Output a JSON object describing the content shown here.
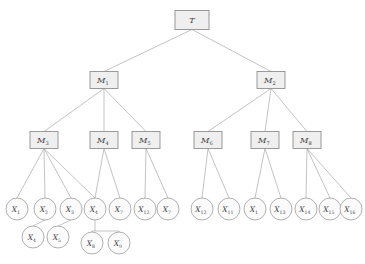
{
  "diagram": {
    "type": "tree",
    "corner_artifact": "",
    "style": {
      "background": "#ffffff",
      "edge_color": "#9a9a9a",
      "box_fill": "#efefef",
      "box_stroke": "#8f8f8f",
      "circle_fill": "#fbfbfb",
      "circle_stroke": "#8f8f8f",
      "label_color": "#3b3b3b"
    },
    "levels": [
      {
        "name": "root",
        "label": "Level 0"
      },
      {
        "name": "m-level-1",
        "label": "Level 1"
      },
      {
        "name": "m-level-2",
        "label": "Level 2"
      },
      {
        "name": "leaf-level",
        "label": "Level 3"
      },
      {
        "name": "sub-leaf-level",
        "label": "Level 4"
      }
    ],
    "nodes": [
      {
        "id": "T",
        "base": "T",
        "sub": "",
        "shape": "box",
        "x": 192,
        "y": 20,
        "w": 34,
        "h": 19
      },
      {
        "id": "M1",
        "base": "M",
        "sub": "1",
        "shape": "box",
        "x": 104,
        "y": 80,
        "w": 28,
        "h": 17
      },
      {
        "id": "M2",
        "base": "M",
        "sub": "2",
        "shape": "box",
        "x": 271,
        "y": 80,
        "w": 28,
        "h": 17
      },
      {
        "id": "M3",
        "base": "M",
        "sub": "3",
        "shape": "box",
        "x": 44,
        "y": 140,
        "w": 28,
        "h": 17
      },
      {
        "id": "M4",
        "base": "M",
        "sub": "4",
        "shape": "box",
        "x": 104,
        "y": 140,
        "w": 28,
        "h": 17
      },
      {
        "id": "M5",
        "base": "M",
        "sub": "5",
        "shape": "box",
        "x": 146,
        "y": 140,
        "w": 28,
        "h": 17
      },
      {
        "id": "M6",
        "base": "M",
        "sub": "6",
        "shape": "box",
        "x": 208,
        "y": 140,
        "w": 28,
        "h": 17
      },
      {
        "id": "M7",
        "base": "M",
        "sub": "7",
        "shape": "box",
        "x": 265,
        "y": 140,
        "w": 28,
        "h": 17
      },
      {
        "id": "M8",
        "base": "M",
        "sub": "8",
        "shape": "box",
        "x": 307,
        "y": 140,
        "w": 28,
        "h": 17
      },
      {
        "id": "X1",
        "base": "X",
        "sub": "1",
        "shape": "circle",
        "x": 17,
        "y": 209,
        "r": 11
      },
      {
        "id": "X2",
        "base": "X",
        "sub": "2",
        "shape": "circle",
        "x": 45,
        "y": 209,
        "r": 11
      },
      {
        "id": "X3",
        "base": "X",
        "sub": "3",
        "shape": "circle",
        "x": 71,
        "y": 209,
        "r": 11
      },
      {
        "id": "X4",
        "base": "X",
        "sub": "4",
        "shape": "circle",
        "x": 95,
        "y": 209,
        "r": 11
      },
      {
        "id": "X7a",
        "base": "X",
        "sub": "7",
        "shape": "circle",
        "x": 120,
        "y": 209,
        "r": 11
      },
      {
        "id": "X12a",
        "base": "X",
        "sub": "12",
        "shape": "circle",
        "x": 145,
        "y": 209,
        "r": 11
      },
      {
        "id": "X7b",
        "base": "X",
        "sub": "7",
        "shape": "circle",
        "x": 168,
        "y": 209,
        "r": 11
      },
      {
        "id": "X12b",
        "base": "X",
        "sub": "12",
        "shape": "circle",
        "x": 202,
        "y": 209,
        "r": 11
      },
      {
        "id": "X11",
        "base": "X",
        "sub": "11",
        "shape": "circle",
        "x": 229,
        "y": 209,
        "r": 11
      },
      {
        "id": "X1b",
        "base": "X",
        "sub": "1",
        "shape": "circle",
        "x": 255,
        "y": 209,
        "r": 11
      },
      {
        "id": "X13",
        "base": "X",
        "sub": "13",
        "shape": "circle",
        "x": 281,
        "y": 209,
        "r": 11
      },
      {
        "id": "X14",
        "base": "X",
        "sub": "14",
        "shape": "circle",
        "x": 306,
        "y": 209,
        "r": 11
      },
      {
        "id": "X15",
        "base": "X",
        "sub": "15",
        "shape": "circle",
        "x": 330,
        "y": 209,
        "r": 11
      },
      {
        "id": "X16",
        "base": "X",
        "sub": "16",
        "shape": "circle",
        "x": 351,
        "y": 209,
        "r": 11
      },
      {
        "id": "X4b",
        "base": "X",
        "sub": "4",
        "shape": "circle",
        "x": 33,
        "y": 237,
        "r": 11
      },
      {
        "id": "X5",
        "base": "X",
        "sub": "5",
        "shape": "circle",
        "x": 58,
        "y": 237,
        "r": 11
      },
      {
        "id": "X8",
        "base": "X",
        "sub": "8",
        "shape": "circle",
        "x": 92,
        "y": 243,
        "r": 11
      },
      {
        "id": "X9",
        "base": "X",
        "sub": "9",
        "shape": "circle",
        "x": 119,
        "y": 243,
        "r": 11
      }
    ],
    "edges": [
      {
        "from": "T",
        "to": "M1"
      },
      {
        "from": "T",
        "to": "M2"
      },
      {
        "from": "M1",
        "to": "M3"
      },
      {
        "from": "M1",
        "to": "M4"
      },
      {
        "from": "M1",
        "to": "M5"
      },
      {
        "from": "M2",
        "to": "M6"
      },
      {
        "from": "M2",
        "to": "M7"
      },
      {
        "from": "M2",
        "to": "M8"
      },
      {
        "from": "M3",
        "to": "X1"
      },
      {
        "from": "M3",
        "to": "X2"
      },
      {
        "from": "M3",
        "to": "X3"
      },
      {
        "from": "M3",
        "to": "X4"
      },
      {
        "from": "M4",
        "to": "X4"
      },
      {
        "from": "M4",
        "to": "X7a"
      },
      {
        "from": "M5",
        "to": "X12a"
      },
      {
        "from": "M5",
        "to": "X7b"
      },
      {
        "from": "M6",
        "to": "X12b"
      },
      {
        "from": "M6",
        "to": "X11"
      },
      {
        "from": "M7",
        "to": "X1b"
      },
      {
        "from": "M7",
        "to": "X13"
      },
      {
        "from": "M8",
        "to": "X14"
      },
      {
        "from": "M8",
        "to": "X15"
      },
      {
        "from": "M8",
        "to": "X16"
      },
      {
        "from": "X2",
        "to": "X4b"
      },
      {
        "from": "X3",
        "to": "X5"
      }
    ],
    "bracket_connectors": [
      {
        "name": "x4-bracket",
        "parent": "X4",
        "children": [
          "X8",
          "X9"
        ],
        "stem_y": 226,
        "bar_y": 231
      }
    ]
  }
}
